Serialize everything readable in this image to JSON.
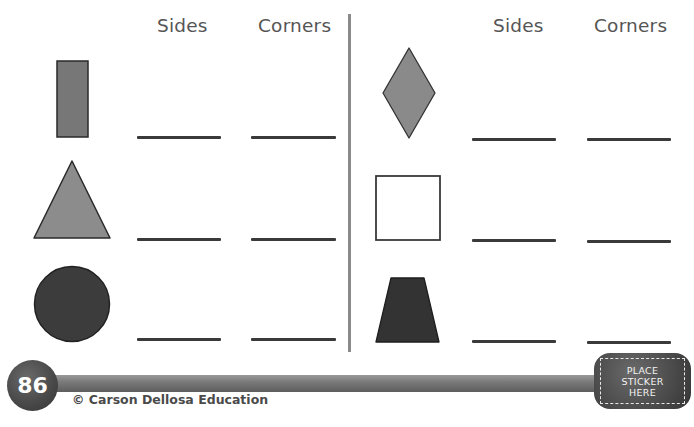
{
  "worksheet": {
    "left_table": {
      "headers": {
        "sides": "Sides",
        "corners": "Corners"
      },
      "rows": [
        {
          "shape": "rectangle",
          "fill": "#777777",
          "sides_answer": "",
          "corners_answer": ""
        },
        {
          "shape": "triangle",
          "fill": "#8c8c8c",
          "sides_answer": "",
          "corners_answer": ""
        },
        {
          "shape": "circle",
          "fill": "#3c3c3c",
          "sides_answer": "",
          "corners_answer": ""
        }
      ]
    },
    "right_table": {
      "headers": {
        "sides": "Sides",
        "corners": "Corners"
      },
      "rows": [
        {
          "shape": "rhombus",
          "fill": "#8a8a8a",
          "sides_answer": "",
          "corners_answer": ""
        },
        {
          "shape": "square",
          "fill": "#ffffff",
          "sides_answer": "",
          "corners_answer": ""
        },
        {
          "shape": "trapezoid",
          "fill": "#333333",
          "sides_answer": "",
          "corners_answer": ""
        }
      ]
    }
  },
  "footer": {
    "page_number": "86",
    "copyright": "© Carson Dellosa Education",
    "sticker": {
      "line1": "PLACE",
      "line2": "STICKER",
      "line3": "HERE"
    }
  },
  "colors": {
    "header_text": "#555555",
    "answer_line": "#3a3a3a",
    "divider": "#8a8a8a",
    "footer_dark": "#4a4a4a"
  }
}
